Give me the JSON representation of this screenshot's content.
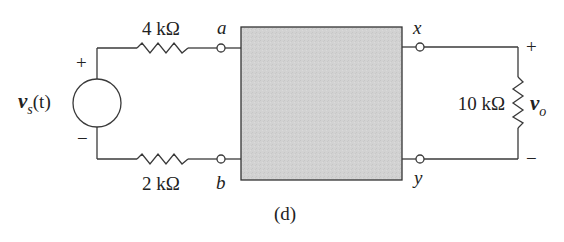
{
  "diagram": {
    "type": "circuit-schematic",
    "caption": "(d)",
    "colors": {
      "wire": "#3a3a3a",
      "box_fill": "#d0d0d0",
      "box_stroke": "#333333",
      "terminal_fill": "#ffffff"
    },
    "source": {
      "label_main": "v",
      "label_sub": "s",
      "label_arg": "(t)",
      "plus": "+",
      "minus": "−"
    },
    "resistors": {
      "top": {
        "label": "4 kΩ"
      },
      "bottom": {
        "label": "2 kΩ"
      },
      "load": {
        "label": "10 kΩ"
      }
    },
    "terminals": {
      "a": "a",
      "b": "b",
      "x": "x",
      "y": "y"
    },
    "output": {
      "label_main": "v",
      "label_sub": "o",
      "plus": "+",
      "minus": "−"
    },
    "network_box": {
      "label": ""
    }
  }
}
